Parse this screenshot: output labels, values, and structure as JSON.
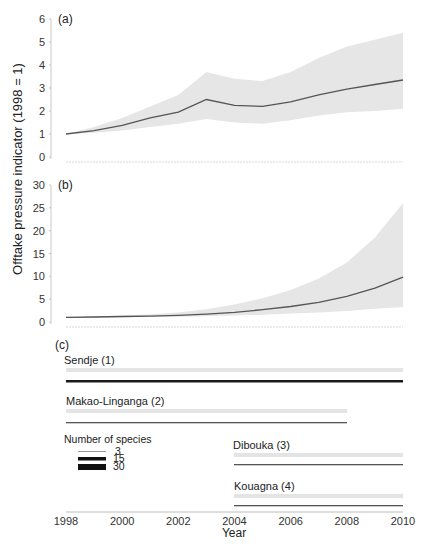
{
  "chart_data": [
    {
      "panel": "(a)",
      "type": "line",
      "ylabel": "Offtake pressure indicator (1998 = 1)",
      "xlabel": "Year",
      "ylim": [
        0,
        6
      ],
      "yticks": [
        0,
        1,
        2,
        3,
        4,
        5,
        6
      ],
      "x": [
        1998,
        1999,
        2000,
        2001,
        2002,
        2003,
        2004,
        2005,
        2006,
        2007,
        2008,
        2009,
        2010
      ],
      "series": [
        {
          "name": "mean",
          "values": [
            1.0,
            1.15,
            1.38,
            1.7,
            1.95,
            2.5,
            2.25,
            2.2,
            2.4,
            2.7,
            2.95,
            3.15,
            3.35
          ]
        },
        {
          "name": "upper",
          "values": [
            1.0,
            1.3,
            1.7,
            2.2,
            2.7,
            3.7,
            3.4,
            3.3,
            3.7,
            4.3,
            4.8,
            5.1,
            5.4
          ]
        },
        {
          "name": "lower",
          "values": [
            1.0,
            1.05,
            1.15,
            1.3,
            1.45,
            1.65,
            1.5,
            1.45,
            1.6,
            1.8,
            1.95,
            2.0,
            2.1
          ]
        }
      ],
      "grid": false
    },
    {
      "panel": "(b)",
      "type": "line",
      "ylim": [
        0,
        30
      ],
      "yticks": [
        0,
        5,
        10,
        15,
        20,
        25,
        30
      ],
      "x": [
        1998,
        1999,
        2000,
        2001,
        2002,
        2003,
        2004,
        2005,
        2006,
        2007,
        2008,
        2009,
        2010
      ],
      "series": [
        {
          "name": "mean",
          "values": [
            1.0,
            1.1,
            1.2,
            1.3,
            1.45,
            1.7,
            2.1,
            2.7,
            3.4,
            4.3,
            5.6,
            7.4,
            9.8
          ]
        },
        {
          "name": "upper",
          "values": [
            1.0,
            1.2,
            1.4,
            1.7,
            2.1,
            2.8,
            3.8,
            5.2,
            7.0,
            9.5,
            13.0,
            18.5,
            26.0
          ]
        },
        {
          "name": "lower",
          "values": [
            1.0,
            1.0,
            1.05,
            1.1,
            1.15,
            1.25,
            1.4,
            1.6,
            1.85,
            2.1,
            2.4,
            2.9,
            3.3
          ]
        }
      ],
      "grid": false
    },
    {
      "panel": "(c)",
      "type": "bar",
      "title": "Survey periods per site",
      "sites": [
        {
          "name": "Sendje (1)",
          "start": 1998,
          "end": 2010,
          "species": 30
        },
        {
          "name": "Makao-Linganga (2)",
          "start": 1998,
          "end": 2008,
          "species": 15
        },
        {
          "name": "Dibouka (3)",
          "start": 2004,
          "end": 2010,
          "species": 15
        },
        {
          "name": "Kouagna (4)",
          "start": 2004,
          "end": 2010,
          "species": 15
        }
      ],
      "legend": {
        "title": "Number of species",
        "entries": [
          3,
          15,
          30
        ]
      },
      "xticks": [
        1998,
        2000,
        2002,
        2004,
        2006,
        2008,
        2010
      ],
      "xlabel": "Year"
    }
  ],
  "labels": {
    "ylabel": "Offtake pressure indicator (1998 = 1)",
    "xlabel": "Year",
    "panel_a": "(a)",
    "panel_b": "(b)",
    "panel_c": "(c)",
    "legend_title": "Number of species",
    "legend_3": "3",
    "legend_15": "15",
    "legend_30": "30",
    "site_1": "Sendje (1)",
    "site_2": "Makao-Linganga (2)",
    "site_3": "Dibouka (3)",
    "site_4": "Kouagna (4)"
  },
  "colors": {
    "band": "#e6e6e6",
    "line": "#555555",
    "axis": "#c8c8c8",
    "site_band": "#e4e4e4",
    "site_line": "#333333"
  }
}
